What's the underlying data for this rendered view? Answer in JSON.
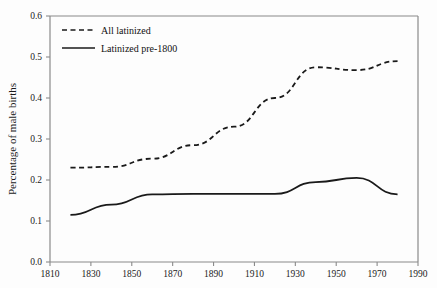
{
  "chart_data": {
    "type": "line",
    "title": "",
    "xlabel": "",
    "ylabel": "Percentage of male births",
    "xlim": [
      1810,
      1990
    ],
    "ylim": [
      0.0,
      0.6
    ],
    "xticks": [
      1810,
      1830,
      1850,
      1870,
      1890,
      1910,
      1930,
      1950,
      1970,
      1990
    ],
    "xtick_labels": [
      "1810",
      "1830",
      "1850",
      "1870",
      "1890",
      "1910",
      "1930",
      "1950",
      "1970",
      "1990"
    ],
    "yticks": [
      0.0,
      0.1,
      0.2,
      0.3,
      0.4,
      0.5,
      0.6
    ],
    "ytick_labels": [
      "0.0",
      "0.1",
      "0.2",
      "0.3",
      "0.4",
      "0.5",
      "0.6"
    ],
    "grid": false,
    "legend_position": "top-left",
    "x": [
      1820,
      1840,
      1860,
      1880,
      1900,
      1920,
      1940,
      1960,
      1980
    ],
    "series": [
      {
        "name": "All latinized",
        "style": "dashed",
        "color": "#1a1a1a",
        "values": [
          0.23,
          0.232,
          0.252,
          0.285,
          0.33,
          0.4,
          0.475,
          0.468,
          0.49
        ]
      },
      {
        "name": "Latinized pre-1800",
        "style": "solid",
        "color": "#1a1a1a",
        "values": [
          0.115,
          0.14,
          0.165,
          0.166,
          0.166,
          0.166,
          0.195,
          0.205,
          0.165
        ]
      }
    ]
  },
  "legend": {
    "entries": [
      {
        "label": "All latinized",
        "style": "dashed"
      },
      {
        "label": "Latinized pre-1800",
        "style": "solid"
      }
    ]
  },
  "axes": {
    "y_axis_title": "Percentage of male births"
  },
  "colors": {
    "line": "#1a1a1a",
    "axis": "#8a8a8a",
    "text": "#1a1a1a",
    "background": "#fdfdfd"
  }
}
